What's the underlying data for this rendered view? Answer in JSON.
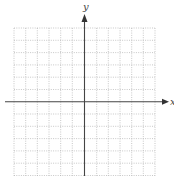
{
  "diagram": {
    "type": "coordinate-grid",
    "x_axis_label": "x",
    "y_axis_label": "y",
    "grid": {
      "columns": 12,
      "rows": 13,
      "line_style": "dotted",
      "line_color": "#b0b0b0"
    },
    "axis_color": "#444444"
  }
}
